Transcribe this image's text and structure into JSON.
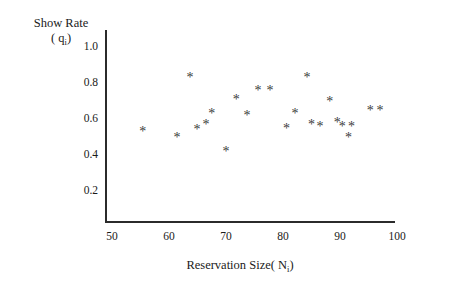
{
  "chart_data": {
    "type": "scatter",
    "title": "",
    "xlabel": "Reservation Size( Ni)",
    "ylabel": "Show Rate ( qi)",
    "ylabel_line1": "Show Rate",
    "ylabel_line2_prefix": "( q",
    "ylabel_line2_sub": "i",
    "ylabel_line2_suffix": ")",
    "xlabel_prefix": "Reservation Size( N",
    "xlabel_sub": "i",
    "xlabel_suffix": ")",
    "xlim": [
      48,
      101
    ],
    "ylim": [
      0.0,
      1.08
    ],
    "xticks": [
      50,
      60,
      70,
      80,
      90,
      100
    ],
    "xticklabels": [
      "50",
      "60",
      "70",
      "80",
      "90",
      "100"
    ],
    "yticks": [
      0.2,
      0.4,
      0.6,
      0.8,
      1.0
    ],
    "yticklabels": [
      "0.2",
      "0.4",
      "0.6",
      "0.8",
      "1.0"
    ],
    "grid": false,
    "legend": null,
    "marker": "asterisk",
    "marker_color": "#3a3a3a",
    "axis_color": "#2b2b2b",
    "background": "#ffffff",
    "n_points": 23,
    "x": [
      55.4,
      61.4,
      63.7,
      64.9,
      66.5,
      67.5,
      70.0,
      71.8,
      73.7,
      75.6,
      77.7,
      80.6,
      82.1,
      84.2,
      85.0,
      86.5,
      88.2,
      89.5,
      90.4,
      91.5,
      92.0,
      95.3,
      97.0
    ],
    "y": [
      0.53,
      0.5,
      0.83,
      0.54,
      0.57,
      0.63,
      0.42,
      0.71,
      0.62,
      0.76,
      0.76,
      0.55,
      0.63,
      0.83,
      0.57,
      0.56,
      0.7,
      0.58,
      0.56,
      0.5,
      0.56,
      0.65,
      0.65
    ],
    "points": [
      {
        "x": 55.4,
        "y": 0.53
      },
      {
        "x": 61.4,
        "y": 0.5
      },
      {
        "x": 63.7,
        "y": 0.83
      },
      {
        "x": 64.9,
        "y": 0.54
      },
      {
        "x": 66.5,
        "y": 0.57
      },
      {
        "x": 67.5,
        "y": 0.63
      },
      {
        "x": 70.0,
        "y": 0.42
      },
      {
        "x": 71.8,
        "y": 0.71
      },
      {
        "x": 73.7,
        "y": 0.62
      },
      {
        "x": 75.6,
        "y": 0.76
      },
      {
        "x": 77.7,
        "y": 0.76
      },
      {
        "x": 80.6,
        "y": 0.55
      },
      {
        "x": 82.1,
        "y": 0.63
      },
      {
        "x": 84.2,
        "y": 0.83
      },
      {
        "x": 85.0,
        "y": 0.57
      },
      {
        "x": 86.5,
        "y": 0.56
      },
      {
        "x": 88.2,
        "y": 0.7
      },
      {
        "x": 89.5,
        "y": 0.58
      },
      {
        "x": 90.4,
        "y": 0.56
      },
      {
        "x": 91.5,
        "y": 0.5
      },
      {
        "x": 92.0,
        "y": 0.56
      },
      {
        "x": 95.3,
        "y": 0.65
      },
      {
        "x": 97.0,
        "y": 0.65
      }
    ],
    "marker_glyph": "✳"
  },
  "axes_geometry": {
    "x_origin_px": 112,
    "y_of_1_px": 47,
    "px_per_x_unit": 5.7,
    "px_per_y_unit": 180
  }
}
